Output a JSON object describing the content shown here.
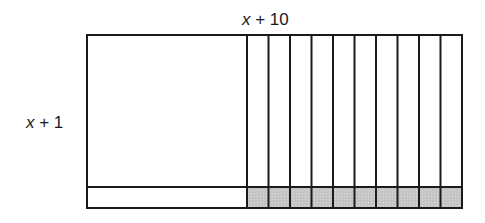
{
  "diagram": {
    "top_label": {
      "variable": "x",
      "rest": " + 10"
    },
    "side_label": {
      "variable": "x",
      "rest": " + 1"
    },
    "geometry": {
      "left": 87,
      "top": 35,
      "right": 462,
      "bottom": 208,
      "square_right": 247,
      "divider_y": 187,
      "strip_count": 10
    },
    "regions": [
      {
        "name": "x-squared",
        "description": "large x by x square",
        "shaded": false
      },
      {
        "name": "x-by-1-strip",
        "description": "x by 1 strip along bottom-left",
        "shaded": false
      },
      {
        "name": "x-by-10-strips",
        "description": "ten x by 1 vertical strips",
        "count": 10,
        "shaded": false
      },
      {
        "name": "unit-squares",
        "description": "ten 1 by 1 unit squares",
        "count": 10,
        "shaded": true
      }
    ],
    "colors": {
      "stroke": "#1a1a1a",
      "shade": "#c6c6c6",
      "background": "#ffffff"
    }
  }
}
